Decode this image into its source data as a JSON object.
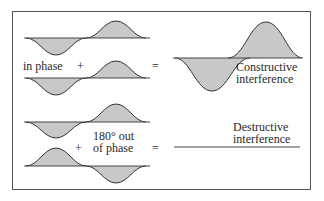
{
  "diagram": {
    "colors": {
      "wave_fill": "#c8c8c8",
      "wave_stroke": "#333333",
      "axis": "#444444",
      "frame": "#555555"
    },
    "constructive": {
      "label": "in phase",
      "plus": "+",
      "equals": "=",
      "result_label_line1": "Constructive",
      "result_label_line2": "interference"
    },
    "destructive": {
      "label_line1": "180° out",
      "label_line2": "of phase",
      "plus": "+",
      "equals": "=",
      "result_label_line1": "Destructive",
      "result_label_line2": "interference"
    }
  }
}
